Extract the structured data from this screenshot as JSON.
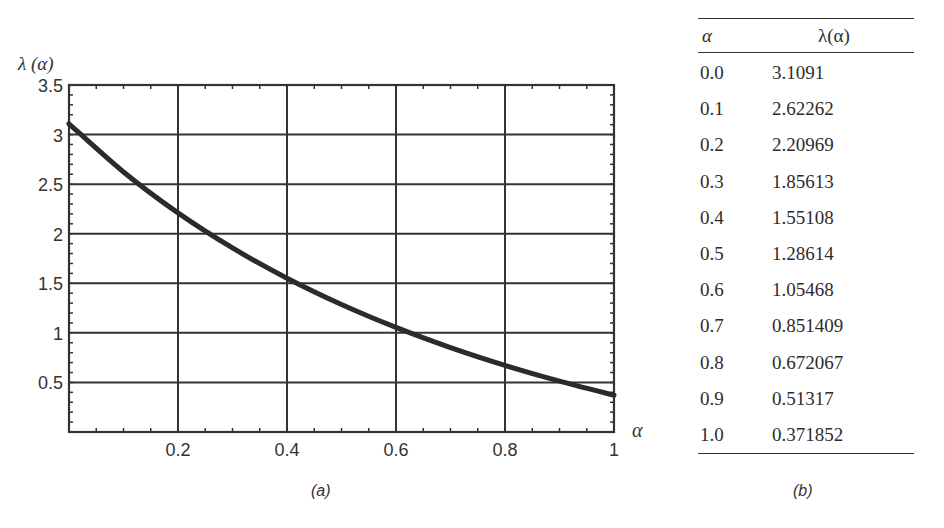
{
  "chart_data": {
    "type": "line",
    "title": "",
    "xlabel": "α",
    "ylabel": "λ (α)",
    "xlim": [
      0,
      1
    ],
    "ylim": [
      0,
      3.5
    ],
    "grid": true,
    "x_ticks": [
      "0.2",
      "0.4",
      "0.6",
      "0.8",
      "1"
    ],
    "y_ticks": [
      "0.5",
      "1",
      "1.5",
      "2",
      "2.5",
      "3",
      "3.5"
    ],
    "series": [
      {
        "name": "λ(α)",
        "x": [
          0.0,
          0.1,
          0.2,
          0.3,
          0.4,
          0.5,
          0.6,
          0.7,
          0.8,
          0.9,
          1.0
        ],
        "values": [
          3.1091,
          2.62262,
          2.20969,
          1.85613,
          1.55108,
          1.28614,
          1.05468,
          0.851409,
          0.672067,
          0.51317,
          0.371852
        ]
      }
    ],
    "caption": "(a)"
  },
  "table": {
    "headers": [
      "α",
      "λ(α)"
    ],
    "rows": [
      [
        "0.0",
        "3.1091"
      ],
      [
        "0.1",
        "2.62262"
      ],
      [
        "0.2",
        "2.20969"
      ],
      [
        "0.3",
        "1.85613"
      ],
      [
        "0.4",
        "1.55108"
      ],
      [
        "0.5",
        "1.28614"
      ],
      [
        "0.6",
        "1.05468"
      ],
      [
        "0.7",
        "0.851409"
      ],
      [
        "0.8",
        "0.672067"
      ],
      [
        "0.9",
        "0.51317"
      ],
      [
        "1.0",
        "0.371852"
      ]
    ],
    "caption": "(b)"
  }
}
